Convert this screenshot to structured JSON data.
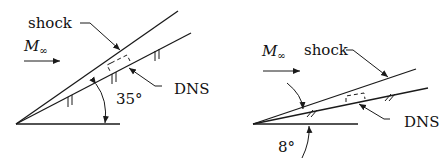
{
  "figure": {
    "panels": [
      {
        "id": "left",
        "labels": {
          "shock": "shock",
          "mach": "M",
          "mach_sub": "∞",
          "dns": "DNS",
          "angle": "35°"
        },
        "wedge_angle_deg": 35
      },
      {
        "id": "right",
        "labels": {
          "shock": "shock",
          "mach": "M",
          "mach_sub": "∞",
          "dns": "DNS",
          "angle": "8°"
        },
        "wedge_angle_deg": 8
      }
    ]
  }
}
